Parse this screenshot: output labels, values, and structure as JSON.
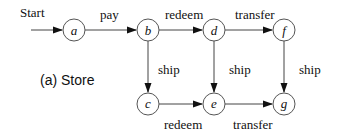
{
  "caption": "(a) Store",
  "start_label": "Start",
  "nodes": [
    {
      "id": "a",
      "label": "a",
      "x": 74,
      "y": 30
    },
    {
      "id": "b",
      "label": "b",
      "x": 148,
      "y": 30
    },
    {
      "id": "d",
      "label": "d",
      "x": 214,
      "y": 30
    },
    {
      "id": "f",
      "label": "f",
      "x": 284,
      "y": 30
    },
    {
      "id": "c",
      "label": "c",
      "x": 148,
      "y": 104
    },
    {
      "id": "e",
      "label": "e",
      "x": 214,
      "y": 104
    },
    {
      "id": "g",
      "label": "g",
      "x": 284,
      "y": 104
    }
  ],
  "edges": [
    {
      "from": "start",
      "to": "a",
      "label": ""
    },
    {
      "from": "a",
      "to": "b",
      "label": "pay"
    },
    {
      "from": "b",
      "to": "d",
      "label": "redeem"
    },
    {
      "from": "d",
      "to": "f",
      "label": "transfer"
    },
    {
      "from": "b",
      "to": "c",
      "label": "ship"
    },
    {
      "from": "d",
      "to": "e",
      "label": "ship"
    },
    {
      "from": "f",
      "to": "g",
      "label": "ship"
    },
    {
      "from": "c",
      "to": "e",
      "label": "redeem"
    },
    {
      "from": "e",
      "to": "g",
      "label": "transfer"
    }
  ]
}
